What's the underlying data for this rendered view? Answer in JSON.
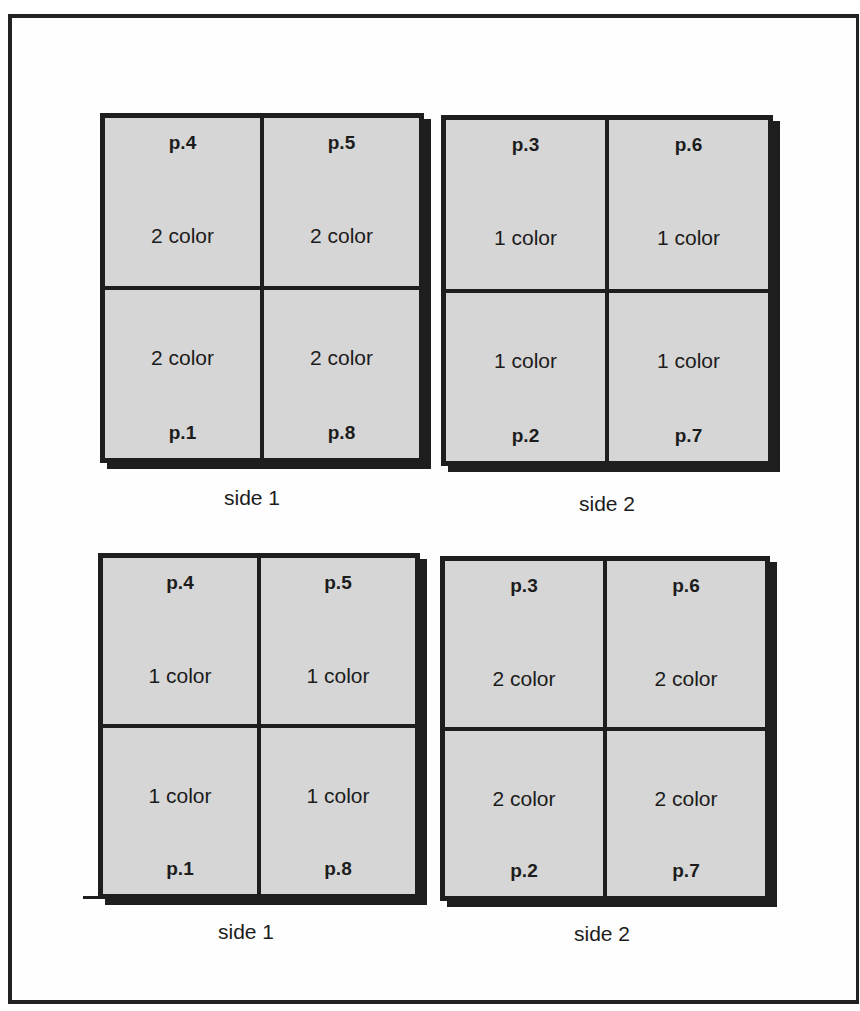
{
  "diagram": {
    "type": "imposition-layout",
    "border_color": "#1e1e1e",
    "sheet_fill": "#d6d6d6",
    "layouts": [
      {
        "sides": [
          {
            "label": "side 1",
            "cells": [
              {
                "page": "p.4",
                "color": "2 color"
              },
              {
                "page": "p.5",
                "color": "2 color"
              },
              {
                "page": "p.1",
                "color": "2 color"
              },
              {
                "page": "p.8",
                "color": "2 color"
              }
            ]
          },
          {
            "label": "side 2",
            "cells": [
              {
                "page": "p.3",
                "color": "1 color"
              },
              {
                "page": "p.6",
                "color": "1 color"
              },
              {
                "page": "p.2",
                "color": "1 color"
              },
              {
                "page": "p.7",
                "color": "1 color"
              }
            ]
          }
        ]
      },
      {
        "sides": [
          {
            "label": "side 1",
            "cells": [
              {
                "page": "p.4",
                "color": "1 color"
              },
              {
                "page": "p.5",
                "color": "1 color"
              },
              {
                "page": "p.1",
                "color": "1 color"
              },
              {
                "page": "p.8",
                "color": "1 color"
              }
            ]
          },
          {
            "label": "side 2",
            "cells": [
              {
                "page": "p.3",
                "color": "2 color"
              },
              {
                "page": "p.6",
                "color": "2 color"
              },
              {
                "page": "p.2",
                "color": "2 color"
              },
              {
                "page": "p.7",
                "color": "2 color"
              }
            ]
          }
        ]
      }
    ]
  }
}
